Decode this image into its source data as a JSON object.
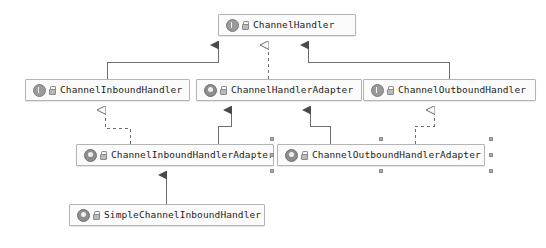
{
  "diagram": {
    "type": "uml-class-diagram",
    "background": "#ffffff",
    "line_color": "#6e6e6e",
    "node_fill": "#fbfbfb",
    "node_border": "#b4b4b4",
    "selection_handle_color": "#a9a9a9"
  },
  "nodes": [
    {
      "id": "channel-handler",
      "name": "ChannelHandler",
      "stereotype": "interface",
      "icon": "interface-icon",
      "visibility_icon": "lock-icon",
      "selected": false,
      "x": 218,
      "y": 14,
      "w": 138
    },
    {
      "id": "channel-inbound-handler",
      "name": "ChannelInboundHandler",
      "stereotype": "interface",
      "icon": "interface-icon",
      "visibility_icon": "lock-icon",
      "selected": false,
      "x": 25,
      "y": 79,
      "w": 165
    },
    {
      "id": "channel-handler-adapter",
      "name": "ChannelHandlerAdapter",
      "stereotype": "class",
      "icon": "class-icon",
      "visibility_icon": "lock-icon",
      "selected": false,
      "x": 196,
      "y": 79,
      "w": 166
    },
    {
      "id": "channel-outbound-handler",
      "name": "ChannelOutboundHandler",
      "stereotype": "interface",
      "icon": "interface-icon",
      "visibility_icon": "lock-icon",
      "selected": false,
      "x": 363,
      "y": 79,
      "w": 173
    },
    {
      "id": "channel-inbound-handler-adapter",
      "name": "ChannelInboundHandlerAdapter",
      "stereotype": "class",
      "icon": "class-icon",
      "visibility_icon": "lock-icon",
      "selected": false,
      "x": 76,
      "y": 144,
      "w": 198
    },
    {
      "id": "channel-outbound-handler-adapter",
      "name": "ChannelOutboundHandlerAdapter",
      "stereotype": "class",
      "icon": "class-icon",
      "visibility_icon": "lock-icon",
      "selected": true,
      "x": 277,
      "y": 144,
      "w": 208
    },
    {
      "id": "simple-channel-inbound-handler",
      "name": "SimpleChannelInboundHandler",
      "stereotype": "class",
      "icon": "class-icon",
      "visibility_icon": "lock-icon",
      "selected": false,
      "x": 69,
      "y": 204,
      "w": 196
    }
  ],
  "edges": [
    {
      "id": "e1",
      "from": "channel-inbound-handler",
      "to": "channel-handler",
      "kind": "generalization",
      "style": "solid",
      "arrow": "filled-triangle"
    },
    {
      "id": "e2",
      "from": "channel-handler-adapter",
      "to": "channel-handler",
      "kind": "realization",
      "style": "dashed",
      "arrow": "hollow-triangle"
    },
    {
      "id": "e3",
      "from": "channel-outbound-handler",
      "to": "channel-handler",
      "kind": "generalization",
      "style": "solid",
      "arrow": "filled-triangle"
    },
    {
      "id": "e4",
      "from": "channel-inbound-handler-adapter",
      "to": "channel-inbound-handler",
      "kind": "realization",
      "style": "dashed",
      "arrow": "hollow-triangle"
    },
    {
      "id": "e5",
      "from": "channel-inbound-handler-adapter",
      "to": "channel-handler-adapter",
      "kind": "generalization",
      "style": "solid",
      "arrow": "filled-triangle"
    },
    {
      "id": "e6",
      "from": "channel-outbound-handler-adapter",
      "to": "channel-handler-adapter",
      "kind": "generalization",
      "style": "solid",
      "arrow": "filled-triangle"
    },
    {
      "id": "e7",
      "from": "channel-outbound-handler-adapter",
      "to": "channel-outbound-handler",
      "kind": "realization",
      "style": "dashed",
      "arrow": "hollow-triangle"
    },
    {
      "id": "e8",
      "from": "simple-channel-inbound-handler",
      "to": "channel-inbound-handler-adapter",
      "kind": "generalization",
      "style": "solid",
      "arrow": "filled-triangle"
    }
  ]
}
